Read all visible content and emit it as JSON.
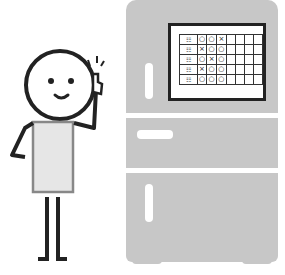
{
  "illustration": {
    "subject": "person pointing at schedule board on refrigerator",
    "colors": {
      "fridge": "#c7c7c7",
      "outline": "#222222",
      "shirt": "#e6e6e6",
      "shirt_border": "#888888",
      "board_bg": "#ffffff"
    },
    "board": {
      "rows": [
        {
          "label": "☷",
          "cells": [
            "○",
            "○",
            "×",
            "",
            "",
            "",
            ""
          ]
        },
        {
          "label": "☷",
          "cells": [
            "×",
            "○",
            "○",
            "",
            "",
            "",
            ""
          ]
        },
        {
          "label": "☷",
          "cells": [
            "○",
            "×",
            "○",
            "",
            "",
            "",
            ""
          ]
        },
        {
          "label": "☷",
          "cells": [
            "×",
            "○",
            "○",
            "",
            "",
            "",
            ""
          ]
        },
        {
          "label": "☷",
          "cells": [
            "○",
            "○",
            "○",
            "",
            "",
            "",
            ""
          ]
        }
      ]
    }
  }
}
